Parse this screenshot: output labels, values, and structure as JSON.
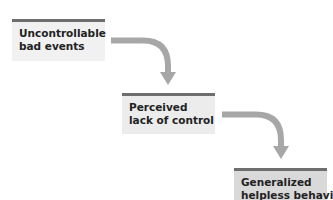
{
  "diagram": {
    "type": "flow",
    "direction": "top-left to bottom-right staircase",
    "colors": {
      "box_fill": "#f1f1f1",
      "box_top_bar": "#6e6e70",
      "arrow": "#a7a7a7",
      "text": "#222222"
    },
    "nodes": [
      {
        "id": "n1",
        "lines": [
          "Uncontrollable",
          "bad events"
        ]
      },
      {
        "id": "n2",
        "lines": [
          "Perceived",
          "lack of control"
        ]
      },
      {
        "id": "n3",
        "lines": [
          "Generalized",
          "helpless behavior"
        ]
      }
    ],
    "edges": [
      {
        "from": "n1",
        "to": "n2",
        "style": "curved-arrow"
      },
      {
        "from": "n2",
        "to": "n3",
        "style": "curved-arrow"
      }
    ]
  }
}
